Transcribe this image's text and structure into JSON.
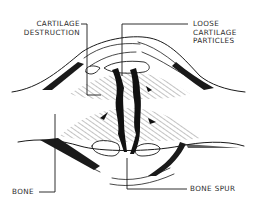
{
  "diagram": {
    "labels": {
      "cartilage_destruction": [
        "CARTILAGE",
        "DESTRUCTION"
      ],
      "loose_cartilage_particles": [
        "LOOSE",
        "CARTILAGE",
        "PARTICLES"
      ],
      "bone": [
        "BONE"
      ],
      "bone_spur": [
        "BONE SPUR"
      ]
    },
    "colors": {
      "ink": "#1a1a1a",
      "text": "#2a2a2a",
      "background": "#ffffff"
    }
  }
}
